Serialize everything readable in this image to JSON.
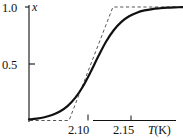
{
  "figure": {
    "name": "order-parameter-vs-temperature",
    "background_color": "#ffffff",
    "line_color": "#111111"
  },
  "chart_data": {
    "type": "line",
    "title": "",
    "xlabel": "T(K)",
    "ylabel": "x",
    "xlim": [
      2.075,
      2.175
    ],
    "ylim": [
      0.0,
      1.05
    ],
    "grid": false,
    "legend": null,
    "xticks": [
      2.1,
      2.15
    ],
    "xticklabels": [
      "2.10",
      "2.15"
    ],
    "yticks": [
      0.5,
      1.0
    ],
    "yticklabels": [
      "0.5",
      "1.0"
    ],
    "series": [
      {
        "name": "order parameter x(T)",
        "style": "solid",
        "linewidth": 2.2,
        "color": "#111111",
        "x": [
          2.075,
          2.08,
          2.085,
          2.09,
          2.095,
          2.1,
          2.105,
          2.11,
          2.115,
          2.12,
          2.125,
          2.13,
          2.135,
          2.14,
          2.145,
          2.15,
          2.155,
          2.16,
          2.165,
          2.17,
          2.175
        ],
        "y": [
          0.01,
          0.017,
          0.029,
          0.048,
          0.079,
          0.127,
          0.199,
          0.3,
          0.427,
          0.565,
          0.694,
          0.795,
          0.869,
          0.918,
          0.95,
          0.97,
          0.982,
          0.989,
          0.994,
          0.997,
          0.999
        ]
      },
      {
        "name": "piecewise-linear (tangent) approximation",
        "style": "dashed",
        "linewidth": 1.0,
        "color": "#555555",
        "x": [
          2.0755,
          2.101,
          2.1295,
          2.175
        ],
        "y": [
          0.0,
          0.0,
          1.0,
          1.0
        ]
      }
    ],
    "annotations": []
  },
  "labels": {
    "y_top": "1.0",
    "y_mid": "0.5",
    "y_axis_title": "x",
    "x_first": "2.10",
    "x_second": "2.15",
    "x_axis_title_var": "T",
    "x_axis_title_unit": "(K)"
  }
}
